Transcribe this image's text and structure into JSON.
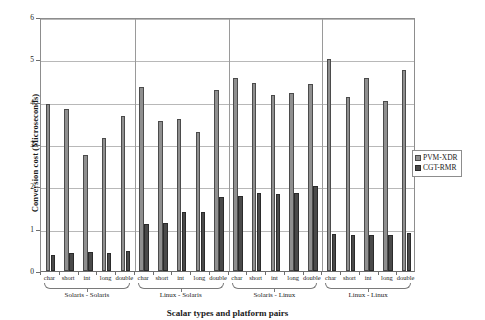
{
  "chart_data": {
    "type": "bar",
    "title": "",
    "xlabel": "Scalar types and platform pairs",
    "ylabel": "Conversion cost (Microseconds)",
    "ylim": [
      0,
      6
    ],
    "yticks": [
      0,
      1,
      2,
      3,
      4,
      5,
      6
    ],
    "grid": true,
    "legend_position": "right",
    "categories": [
      "char",
      "short",
      "int",
      "long",
      "double",
      "char",
      "short",
      "int",
      "long",
      "double",
      "char",
      "short",
      "int",
      "long",
      "double",
      "char",
      "short",
      "int",
      "long",
      "double"
    ],
    "groups": [
      {
        "label": "Solaris - Solaris",
        "categories": [
          "char",
          "short",
          "int",
          "long",
          "double"
        ]
      },
      {
        "label": "Linux - Solaris",
        "categories": [
          "char",
          "short",
          "int",
          "long",
          "double"
        ]
      },
      {
        "label": "Solaris - Linux",
        "categories": [
          "char",
          "short",
          "int",
          "long",
          "double"
        ]
      },
      {
        "label": "Linux - Linux",
        "categories": [
          "char",
          "short",
          "int",
          "long",
          "double"
        ]
      }
    ],
    "series": [
      {
        "name": "PVM-XDR",
        "color": "#8f8f8f",
        "values": [
          3.95,
          3.82,
          2.75,
          3.15,
          3.67,
          4.35,
          3.55,
          3.6,
          3.28,
          4.27,
          4.55,
          4.45,
          4.15,
          4.2,
          4.42,
          5.0,
          4.12,
          4.55,
          4.02,
          4.75
        ]
      },
      {
        "name": "CGT-RMR",
        "color": "#4a4a4a",
        "values": [
          0.38,
          0.42,
          0.45,
          0.43,
          0.47,
          1.1,
          1.13,
          1.4,
          1.4,
          1.75,
          1.78,
          1.85,
          1.82,
          1.85,
          2.0,
          0.88,
          0.86,
          0.85,
          0.86,
          0.9
        ]
      }
    ]
  },
  "legend": {
    "items": [
      {
        "label": "PVM-XDR"
      },
      {
        "label": "CGT-RMR"
      }
    ]
  }
}
